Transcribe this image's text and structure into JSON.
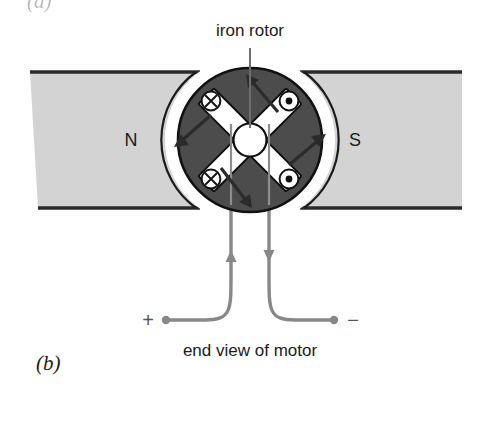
{
  "figure": {
    "panel_label": "(b)",
    "panel_label_partial_top": "(a)",
    "top_caption": "iron rotor",
    "bottom_caption": "end view of motor",
    "pole_left_label": "N",
    "pole_right_label": "S",
    "terminal_positive": "+",
    "terminal_negative": "−"
  },
  "colors": {
    "background": "#ffffff",
    "pole_fill": "#d3d3d3",
    "pole_edge": "#2b2b2b",
    "rotor_fill": "#4c4c4c",
    "rotor_outline": "#111111",
    "slot_white": "#ffffff",
    "wire": "#888888",
    "arrow_dark": "#2b2b2b",
    "text": "#1b1b1b"
  },
  "rotor": {
    "center_x": 250,
    "center_y": 140,
    "radius": 72,
    "hub_radius": 16,
    "coil_markers": [
      {
        "name": "coil-marker-top-left",
        "symbol": "cross",
        "x": 210,
        "y": 101
      },
      {
        "name": "coil-marker-top-right",
        "symbol": "dot",
        "x": 290,
        "y": 101
      },
      {
        "name": "coil-marker-bottom-left",
        "symbol": "cross",
        "x": 210,
        "y": 181
      },
      {
        "name": "coil-marker-bottom-right",
        "symbol": "dot",
        "x": 290,
        "y": 181
      }
    ],
    "rotation_arrows": [
      {
        "name": "rotation-arrow-top",
        "direction": "down-right"
      },
      {
        "name": "rotation-arrow-left",
        "direction": "down-left"
      },
      {
        "name": "rotation-arrow-right",
        "direction": "up-right"
      },
      {
        "name": "rotation-arrow-bottom",
        "direction": "down-right"
      }
    ]
  },
  "wires": {
    "left": {
      "name": "wire-positive",
      "current_direction": "up"
    },
    "right": {
      "name": "wire-negative",
      "current_direction": "down"
    }
  }
}
